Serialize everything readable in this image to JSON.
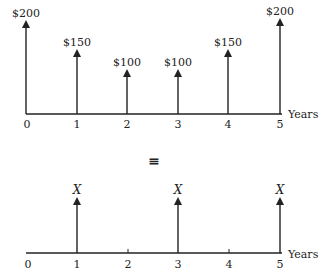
{
  "diagram": {
    "equivalence_symbol": "≡",
    "top": {
      "axis_label": "Years",
      "ticks": [
        "0",
        "1",
        "2",
        "3",
        "4",
        "5"
      ],
      "cash_flows": [
        {
          "year": 0,
          "label": "$200",
          "amount": 200
        },
        {
          "year": 1,
          "label": "$150",
          "amount": 150
        },
        {
          "year": 2,
          "label": "$100",
          "amount": 100
        },
        {
          "year": 3,
          "label": "$100",
          "amount": 100
        },
        {
          "year": 4,
          "label": "$150",
          "amount": 150
        },
        {
          "year": 5,
          "label": "$200",
          "amount": 200
        }
      ]
    },
    "bottom": {
      "axis_label": "Years",
      "ticks": [
        "0",
        "1",
        "2",
        "3",
        "4",
        "5"
      ],
      "cash_flows": [
        {
          "year": 1,
          "label": "X"
        },
        {
          "year": 3,
          "label": "X"
        },
        {
          "year": 5,
          "label": "X"
        }
      ]
    }
  }
}
